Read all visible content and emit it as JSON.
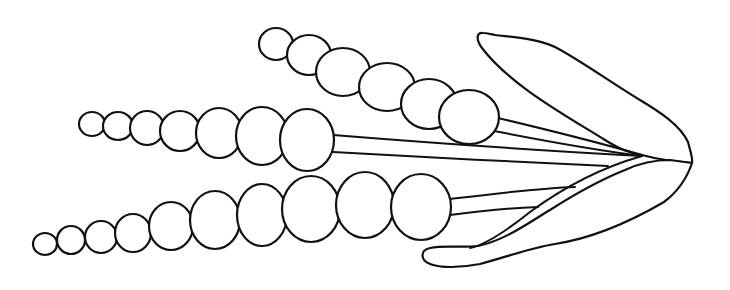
{
  "illustration": {
    "subject": "botanical line drawing of three bead-like spikes on stalks sheathed by two leaves",
    "colors": {
      "background": "#ffffff",
      "ink": "#111111"
    },
    "upper_spike": {
      "beads": [
        {
          "cx": 276,
          "cy": 44,
          "rx": 17,
          "ry": 16
        },
        {
          "cx": 309,
          "cy": 55,
          "rx": 22,
          "ry": 20
        },
        {
          "cx": 339,
          "cy": 70,
          "rx": 27,
          "ry": 24
        },
        {
          "cx": 387,
          "cy": 83,
          "rx": 28,
          "ry": 24
        },
        {
          "cx": 427,
          "cy": 99,
          "rx": 28,
          "ry": 25
        },
        {
          "cx": 468,
          "cy": 117,
          "rx": 31,
          "ry": 26
        }
      ]
    },
    "middle_spike": {
      "beads": [
        {
          "cx": 91,
          "cy": 124,
          "rx": 13,
          "ry": 12
        },
        {
          "cx": 118,
          "cy": 126,
          "rx": 15,
          "ry": 14
        },
        {
          "cx": 146,
          "cy": 128,
          "rx": 17,
          "ry": 17
        },
        {
          "cx": 178,
          "cy": 131,
          "rx": 20,
          "ry": 20
        },
        {
          "cx": 218,
          "cy": 133,
          "rx": 23,
          "ry": 25
        },
        {
          "cx": 263,
          "cy": 136,
          "rx": 26,
          "ry": 29
        },
        {
          "cx": 307,
          "cy": 139,
          "rx": 25,
          "ry": 32
        }
      ]
    },
    "lower_spike": {
      "beads": [
        {
          "cx": 45,
          "cy": 244,
          "rx": 12,
          "ry": 11
        },
        {
          "cx": 71,
          "cy": 240,
          "rx": 14,
          "ry": 14
        },
        {
          "cx": 101,
          "cy": 237,
          "rx": 16,
          "ry": 16
        },
        {
          "cx": 132,
          "cy": 233,
          "rx": 18,
          "ry": 19
        },
        {
          "cx": 170,
          "cy": 226,
          "rx": 22,
          "ry": 24
        },
        {
          "cx": 215,
          "cy": 219,
          "rx": 25,
          "ry": 29
        },
        {
          "cx": 262,
          "cy": 215,
          "rx": 25,
          "ry": 31
        },
        {
          "cx": 310,
          "cy": 208,
          "rx": 29,
          "ry": 33
        },
        {
          "cx": 363,
          "cy": 202,
          "rx": 29,
          "ry": 33
        },
        {
          "cx": 420,
          "cy": 207,
          "rx": 30,
          "ry": 33
        }
      ]
    }
  }
}
